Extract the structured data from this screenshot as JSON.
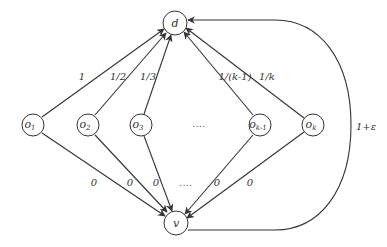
{
  "diagram": {
    "type": "directed-graph",
    "colors": {
      "stroke": "#333333",
      "background": "#ffffff"
    },
    "nodes": {
      "d": {
        "label": "d",
        "x": 175,
        "y": 23
      },
      "v": {
        "label": "v",
        "x": 176,
        "y": 223
      },
      "o1": {
        "base": "o",
        "sub": "1",
        "x": 33,
        "y": 125
      },
      "o2": {
        "base": "o",
        "sub": "2",
        "x": 88,
        "y": 125
      },
      "o3": {
        "base": "o",
        "sub": "3",
        "x": 141,
        "y": 125
      },
      "okm1": {
        "base": "o",
        "sub": "k-1",
        "x": 260,
        "y": 125
      },
      "ok": {
        "base": "o",
        "sub": "k",
        "x": 313,
        "y": 125
      }
    },
    "middle_dots": "....",
    "upper_edge_labels": {
      "o1": "1",
      "o2": "1/2",
      "o3": "1/3",
      "okm1": "1/(k-1)",
      "ok": "1/k"
    },
    "lower_edge_labels": {
      "o1": "0",
      "o2": "0",
      "o3": "0",
      "middle": "....",
      "okm1": "0",
      "ok": "0"
    },
    "back_edge_label": "1+ε"
  }
}
